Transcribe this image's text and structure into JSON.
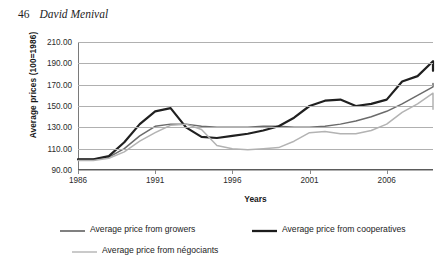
{
  "page": {
    "folio": "46",
    "author": "David Menival"
  },
  "chart_data": {
    "type": "line",
    "title": "",
    "xlabel": "Years",
    "ylabel": "Average prices (100=1986)",
    "xlim": [
      1986,
      2009
    ],
    "ylim": [
      90,
      210
    ],
    "ytick_labels": [
      "210.00",
      "190.00",
      "170.00",
      "150.00",
      "130.00",
      "110.00",
      "90.00"
    ],
    "ytick_values": [
      210,
      190,
      170,
      150,
      130,
      110,
      90
    ],
    "xtick_labels": [
      "1986",
      "1991",
      "1996",
      "2001",
      "2006"
    ],
    "xtick_values": [
      1986,
      1991,
      1996,
      2001,
      2006
    ],
    "grid": true,
    "legend_position": "bottom",
    "x": [
      1986,
      1987,
      1988,
      1989,
      1990,
      1991,
      1992,
      1993,
      1994,
      1995,
      1996,
      1997,
      1998,
      1999,
      2000,
      2001,
      2002,
      2003,
      2004,
      2005,
      2006,
      2007,
      2008,
      2009
    ],
    "series": [
      {
        "name": "Average price from growers",
        "color": "#6b6b6b",
        "width": 1.5,
        "values": [
          100,
          100,
          102,
          110,
          122,
          131,
          133,
          133,
          131,
          130,
          130,
          130,
          131,
          131,
          130,
          130,
          131,
          133,
          136,
          140,
          145,
          152,
          160,
          168
        ]
      },
      {
        "name": "Average price from cooperatives",
        "color": "#202020",
        "width": 2.2,
        "values": [
          100,
          100,
          103,
          116,
          133,
          145,
          148,
          130,
          121,
          120,
          122,
          124,
          127,
          131,
          139,
          150,
          155,
          156,
          150,
          152,
          156,
          173,
          178,
          192
        ]
      },
      {
        "name": "Average price from négociants",
        "color": "#b3b3b3",
        "width": 1.5,
        "values": [
          99,
          99,
          101,
          107,
          117,
          125,
          132,
          133,
          128,
          113,
          110,
          109,
          110,
          111,
          117,
          125,
          126,
          124,
          124,
          127,
          133,
          144,
          152,
          162
        ]
      }
    ],
    "series_endpoints": [
      {
        "name": "Average price from growers",
        "final_value": 171
      },
      {
        "name": "Average price from cooperatives",
        "final_value": 183
      },
      {
        "name": "Average price from négociants",
        "final_value": 147
      }
    ]
  },
  "legend": {
    "items": [
      {
        "label": "Average price from growers"
      },
      {
        "label": "Average price from cooperatives"
      },
      {
        "label": "Average price from négociants"
      }
    ]
  }
}
